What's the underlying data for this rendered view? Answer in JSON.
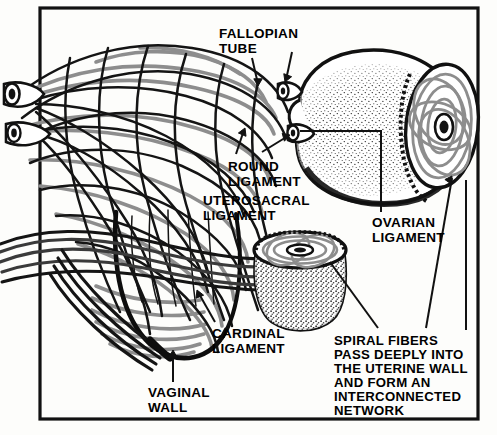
{
  "figure": {
    "title_present": false,
    "frame": {
      "x": 40,
      "y": 8,
      "w": 438,
      "h": 411,
      "stroke": "#111111",
      "width": 3
    },
    "background": "#fdfdfb",
    "ink": "#111111",
    "fiber_gray": "#8d8d8d"
  },
  "labels": [
    {
      "key": "fallopian_tube",
      "text": "FALLOPIAN\nTUBE",
      "x": 219,
      "y": 27,
      "size": 13.5,
      "align": "left"
    },
    {
      "key": "round_ligament",
      "text": "ROUND\nLIGAMENT",
      "x": 228,
      "y": 160,
      "size": 13.5,
      "align": "left"
    },
    {
      "key": "uterosacral_ligament",
      "text": "UTEROSACRAL\nLIGAMENT",
      "x": 203,
      "y": 194,
      "size": 13.5,
      "align": "left"
    },
    {
      "key": "ovarian_ligament",
      "text": "OVARIAN\nLIGAMENT",
      "x": 372,
      "y": 216,
      "size": 13.5,
      "align": "left"
    },
    {
      "key": "cardinal_ligament",
      "text": "CARDINAL\nLIGAMENT",
      "x": 212,
      "y": 327,
      "size": 13.5,
      "align": "left"
    },
    {
      "key": "vaginal_wall",
      "text": "VAGINAL\nWALL",
      "x": 148,
      "y": 386,
      "size": 13.5,
      "align": "left"
    },
    {
      "key": "spiral_fibers_note",
      "text": "SPIRAL FIBERS\nPASS DEEPLY INTO\nTHE UTERINE WALL\nAND FORM AN\nINTERCONNECTED\nNETWORK",
      "x": 334,
      "y": 334,
      "size": 13.2,
      "align": "left"
    }
  ],
  "structures": [
    {
      "key": "fiber-network-uterus",
      "name": "Interwoven spiral fiber network of uterus (left, cutaway)"
    },
    {
      "key": "vaginal-wall-funnel",
      "name": "Vaginal wall funnel with horizontal cardinal ligament bands"
    },
    {
      "key": "stippled-uterus",
      "name": "Stippled uterus with cut face showing concentric spiral fibers (right)"
    },
    {
      "key": "cervix-cone",
      "name": "Truncated cervical cone with spiral fibers on cut top face (center)"
    },
    {
      "key": "fallopian-tube-stumps",
      "name": "Paired fallopian tube stumps"
    },
    {
      "key": "round-ligament-stumps",
      "name": "Paired round ligament stumps"
    }
  ],
  "leaders": [
    {
      "key": "fallopian-left",
      "from_label": "fallopian_tube"
    },
    {
      "key": "fallopian-right",
      "from_label": "fallopian_tube"
    },
    {
      "key": "round-left",
      "from_label": "round_ligament"
    },
    {
      "key": "round-right",
      "from_label": "round_ligament"
    },
    {
      "key": "ovarian-bracket",
      "from_label": "ovarian_ligament"
    },
    {
      "key": "cardinal-arrow",
      "from_label": "cardinal_ligament"
    },
    {
      "key": "vaginal-arrow",
      "from_label": "vaginal_wall"
    },
    {
      "key": "spiral-to-cervix",
      "from_label": "spiral_fibers_note"
    },
    {
      "key": "spiral-to-uterus",
      "from_label": "spiral_fibers_note"
    }
  ]
}
